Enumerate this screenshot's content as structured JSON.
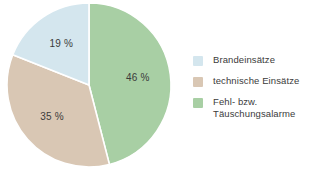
{
  "background": "#ffffff",
  "chart_data": {
    "type": "pie",
    "title": "",
    "categories": [
      "Brandeinsätze",
      "technische Einsätze",
      "Fehl- bzw. Täuschungsalarme"
    ],
    "values": [
      19,
      35,
      46
    ],
    "unit": "%",
    "data_labels": [
      "19 %",
      "35 %",
      "46 %"
    ],
    "colors": [
      "#d4e6ee",
      "#d9c7b4",
      "#a8cfa4"
    ],
    "start_angle_deg": 0,
    "direction": "clockwise",
    "slice_order": [
      "Fehl- bzw. Täuschungsalarme",
      "technische Einsätze",
      "Brandeinsätze"
    ],
    "slice_border_color": "#ffffff",
    "label_color": "#3b3b3b",
    "legend_position": "right",
    "grid": false
  },
  "pie": {
    "slices": [
      {
        "name": "Fehl- bzw. Täuschungsalarme",
        "label": "46 %",
        "value": 46,
        "color": "#a8cfa4"
      },
      {
        "name": "technische Einsätze",
        "label": "35 %",
        "value": 35,
        "color": "#d9c7b4"
      },
      {
        "name": "Brandeinsätze",
        "label": "19 %",
        "value": 19,
        "color": "#d4e6ee"
      }
    ]
  },
  "legend": {
    "items": [
      {
        "label": "Brandeinsätze",
        "color": "#d4e6ee"
      },
      {
        "label": "technische Einsätze",
        "color": "#d9c7b4"
      },
      {
        "label": "Fehl- bzw.\nTäuschungsalarme",
        "color": "#a8cfa4"
      }
    ]
  }
}
